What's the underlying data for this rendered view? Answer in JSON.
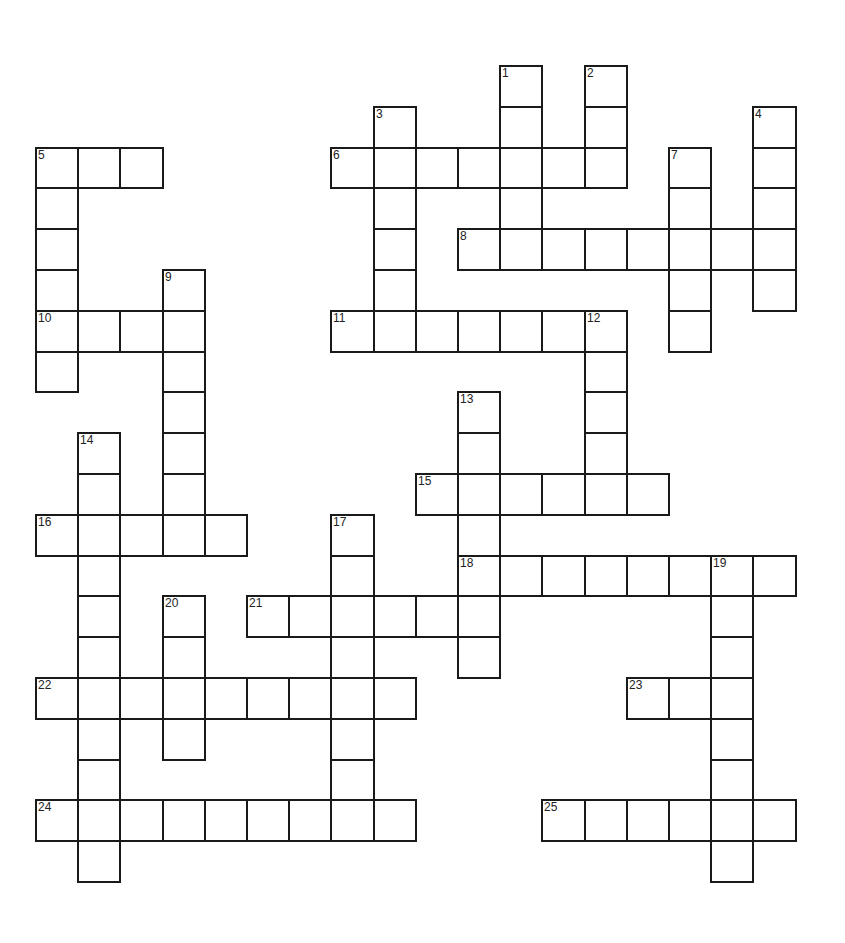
{
  "puzzle": {
    "type": "crossword",
    "grid": {
      "origin_x": 36,
      "origin_y": 66,
      "cell_w": 42.2,
      "cell_h": 40.8,
      "cols": 18,
      "rows": 20
    },
    "colors": {
      "line": "#1a1a1a",
      "cell_fill": "#ffffff",
      "number": "#222222"
    },
    "entries": [
      {
        "number": 1,
        "direction": "down",
        "row": 0,
        "col": 11,
        "length": 5
      },
      {
        "number": 2,
        "direction": "down",
        "row": 0,
        "col": 13,
        "length": 3
      },
      {
        "number": 3,
        "direction": "down",
        "row": 1,
        "col": 8,
        "length": 6
      },
      {
        "number": 4,
        "direction": "down",
        "row": 1,
        "col": 17,
        "length": 5
      },
      {
        "number": 5,
        "direction": "across",
        "row": 2,
        "col": 0,
        "length": 3
      },
      {
        "number": 5,
        "direction": "down",
        "row": 2,
        "col": 0,
        "length": 6
      },
      {
        "number": 6,
        "direction": "across",
        "row": 2,
        "col": 7,
        "length": 7
      },
      {
        "number": 7,
        "direction": "down",
        "row": 2,
        "col": 15,
        "length": 5
      },
      {
        "number": 8,
        "direction": "across",
        "row": 4,
        "col": 10,
        "length": 8
      },
      {
        "number": 9,
        "direction": "down",
        "row": 5,
        "col": 3,
        "length": 6
      },
      {
        "number": 10,
        "direction": "across",
        "row": 6,
        "col": 0,
        "length": 4
      },
      {
        "number": 11,
        "direction": "across",
        "row": 6,
        "col": 7,
        "length": 7
      },
      {
        "number": 12,
        "direction": "down",
        "row": 6,
        "col": 13,
        "length": 5
      },
      {
        "number": 13,
        "direction": "down",
        "row": 8,
        "col": 10,
        "length": 7
      },
      {
        "number": 14,
        "direction": "down",
        "row": 9,
        "col": 1,
        "length": 11
      },
      {
        "number": 15,
        "direction": "across",
        "row": 10,
        "col": 9,
        "length": 6
      },
      {
        "number": 16,
        "direction": "across",
        "row": 11,
        "col": 0,
        "length": 5
      },
      {
        "number": 17,
        "direction": "down",
        "row": 11,
        "col": 7,
        "length": 8
      },
      {
        "number": 18,
        "direction": "across",
        "row": 12,
        "col": 10,
        "length": 8
      },
      {
        "number": 19,
        "direction": "down",
        "row": 12,
        "col": 16,
        "length": 8
      },
      {
        "number": 20,
        "direction": "down",
        "row": 13,
        "col": 3,
        "length": 4
      },
      {
        "number": 21,
        "direction": "across",
        "row": 13,
        "col": 5,
        "length": 6
      },
      {
        "number": 22,
        "direction": "across",
        "row": 15,
        "col": 0,
        "length": 9
      },
      {
        "number": 23,
        "direction": "across",
        "row": 15,
        "col": 14,
        "length": 3
      },
      {
        "number": 24,
        "direction": "across",
        "row": 18,
        "col": 0,
        "length": 9
      },
      {
        "number": 25,
        "direction": "across",
        "row": 18,
        "col": 12,
        "length": 6
      }
    ]
  }
}
